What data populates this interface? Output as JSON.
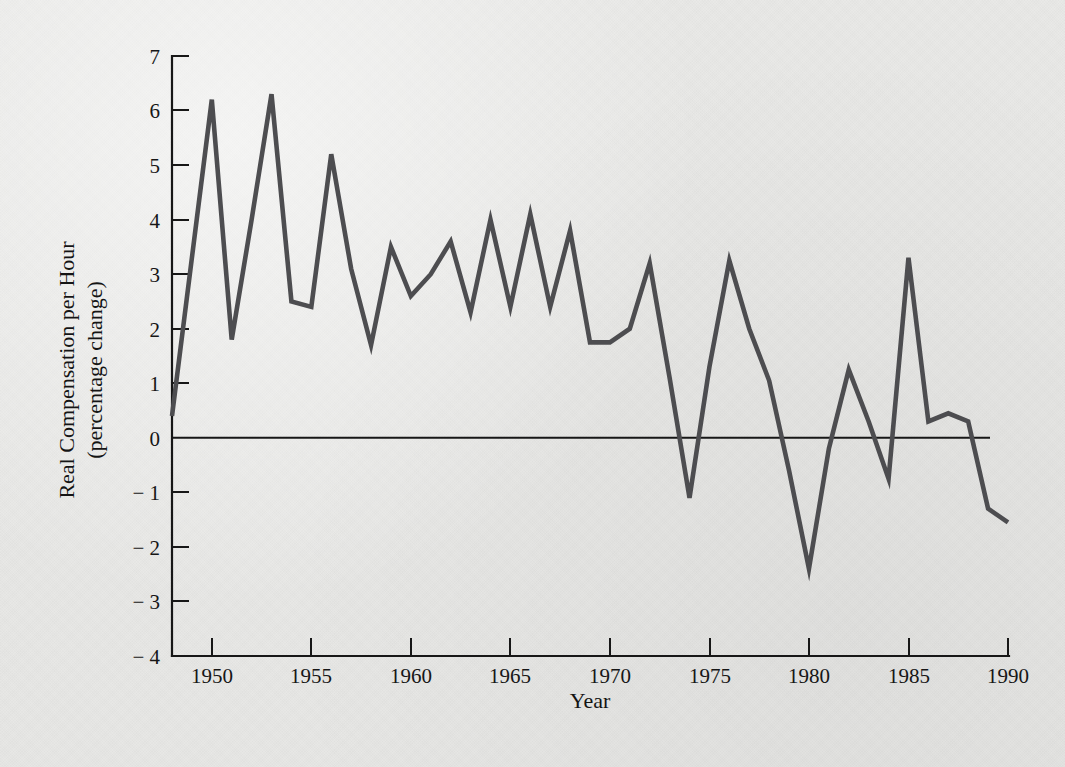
{
  "figure": {
    "background_color": "#e9e9e7",
    "line_color": "#4d4d50",
    "axis_color": "#171717"
  },
  "axes": {
    "y_title_line1": "Real Compensation per Hour",
    "y_title_line2": "(percentage change)",
    "x_title": "Year",
    "y_ticks": [
      "7",
      "6",
      "5",
      "4",
      "3",
      "2",
      "1",
      "0",
      "− 1",
      "− 2",
      "− 3",
      "− 4"
    ],
    "x_ticks": [
      "1950",
      "1955",
      "1960",
      "1965",
      "1970",
      "1975",
      "1980",
      "1985",
      "1990"
    ]
  },
  "chart_data": {
    "type": "line",
    "title": "",
    "xlabel": "Year",
    "ylabel": "Real Compensation per Hour (percentage change)",
    "xlim": [
      1948,
      1990
    ],
    "ylim": [
      -4,
      7
    ],
    "yticks": [
      -4,
      -3,
      -2,
      -1,
      0,
      1,
      2,
      3,
      4,
      5,
      6,
      7
    ],
    "xticks": [
      1950,
      1955,
      1960,
      1965,
      1970,
      1975,
      1980,
      1985,
      1990
    ],
    "grid": false,
    "legend": null,
    "zero_reference_line": 0,
    "series": [
      {
        "name": "Real Compensation per Hour",
        "x": [
          1948,
          1949,
          1950,
          1951,
          1952,
          1953,
          1954,
          1955,
          1956,
          1957,
          1958,
          1959,
          1960,
          1961,
          1962,
          1963,
          1964,
          1965,
          1966,
          1967,
          1968,
          1969,
          1970,
          1971,
          1972,
          1973,
          1974,
          1975,
          1976,
          1977,
          1978,
          1979,
          1980,
          1981,
          1982,
          1983,
          1984,
          1985,
          1986,
          1987,
          1988,
          1989,
          1990
        ],
        "values": [
          0.4,
          3.3,
          6.2,
          1.8,
          4.0,
          6.3,
          2.5,
          2.4,
          5.2,
          3.1,
          1.7,
          3.5,
          2.6,
          3.0,
          3.6,
          2.3,
          4.0,
          2.4,
          4.1,
          2.4,
          3.8,
          1.75,
          1.75,
          2.0,
          3.2,
          1.1,
          -1.1,
          1.3,
          3.25,
          2.0,
          1.05,
          -0.6,
          -2.4,
          -0.2,
          1.25,
          0.3,
          -0.75,
          3.3,
          0.3,
          0.45,
          0.3,
          -1.3,
          -1.55
        ]
      }
    ]
  }
}
